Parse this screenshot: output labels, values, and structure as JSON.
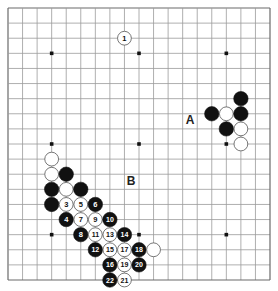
{
  "diagram": {
    "type": "go-board",
    "size": 19,
    "colors": {
      "background": "#ffffff",
      "grid_line": "#9a9a9a",
      "edge_line": "#6a6a6a",
      "black_stone": "#111111",
      "white_stone": "#ffffff",
      "white_stone_border": "#555555",
      "hoshi": "#111111",
      "label_text": "#222222"
    },
    "hoshi": [
      {
        "col": 3,
        "row": 3
      },
      {
        "col": 9,
        "row": 3
      },
      {
        "col": 15,
        "row": 3
      },
      {
        "col": 3,
        "row": 9
      },
      {
        "col": 9,
        "row": 9
      },
      {
        "col": 15,
        "row": 9
      },
      {
        "col": 3,
        "row": 15
      },
      {
        "col": 9,
        "row": 15
      },
      {
        "col": 15,
        "row": 15
      }
    ],
    "stones": [
      {
        "color": "white",
        "col": 8,
        "row": 2,
        "label": "1"
      },
      {
        "color": "black",
        "col": 16,
        "row": 6,
        "label": ""
      },
      {
        "color": "black",
        "col": 14,
        "row": 7,
        "label": ""
      },
      {
        "color": "white",
        "col": 15,
        "row": 7,
        "label": ""
      },
      {
        "color": "black",
        "col": 16,
        "row": 7,
        "label": ""
      },
      {
        "color": "black",
        "col": 15,
        "row": 8,
        "label": ""
      },
      {
        "color": "white",
        "col": 16,
        "row": 8,
        "label": ""
      },
      {
        "color": "white",
        "col": 16,
        "row": 9,
        "label": ""
      },
      {
        "color": "white",
        "col": 3,
        "row": 10,
        "label": ""
      },
      {
        "color": "white",
        "col": 3,
        "row": 11,
        "label": ""
      },
      {
        "color": "black",
        "col": 4,
        "row": 11,
        "label": ""
      },
      {
        "color": "black",
        "col": 3,
        "row": 12,
        "label": ""
      },
      {
        "color": "white",
        "col": 4,
        "row": 12,
        "label": ""
      },
      {
        "color": "black",
        "col": 5,
        "row": 12,
        "label": ""
      },
      {
        "color": "black",
        "col": 3,
        "row": 13,
        "label": ""
      },
      {
        "color": "white",
        "col": 4,
        "row": 13,
        "label": "3"
      },
      {
        "color": "black",
        "col": 4,
        "row": 14,
        "label": "4"
      },
      {
        "color": "white",
        "col": 5,
        "row": 13,
        "label": "5"
      },
      {
        "color": "black",
        "col": 6,
        "row": 13,
        "label": "6"
      },
      {
        "color": "white",
        "col": 5,
        "row": 14,
        "label": "7"
      },
      {
        "color": "black",
        "col": 5,
        "row": 15,
        "label": "8"
      },
      {
        "color": "white",
        "col": 6,
        "row": 14,
        "label": "9"
      },
      {
        "color": "black",
        "col": 7,
        "row": 14,
        "label": "10"
      },
      {
        "color": "white",
        "col": 6,
        "row": 15,
        "label": "11"
      },
      {
        "color": "black",
        "col": 6,
        "row": 16,
        "label": "12"
      },
      {
        "color": "white",
        "col": 7,
        "row": 15,
        "label": "13"
      },
      {
        "color": "black",
        "col": 8,
        "row": 15,
        "label": "14"
      },
      {
        "color": "white",
        "col": 7,
        "row": 16,
        "label": "15"
      },
      {
        "color": "black",
        "col": 7,
        "row": 17,
        "label": "16"
      },
      {
        "color": "white",
        "col": 8,
        "row": 16,
        "label": "17"
      },
      {
        "color": "black",
        "col": 9,
        "row": 16,
        "label": "18"
      },
      {
        "color": "white",
        "col": 8,
        "row": 17,
        "label": "19"
      },
      {
        "color": "black",
        "col": 9,
        "row": 17,
        "label": "20"
      },
      {
        "color": "white",
        "col": 8,
        "row": 18,
        "label": "21"
      },
      {
        "color": "black",
        "col": 7,
        "row": 18,
        "label": "22"
      },
      {
        "color": "white",
        "col": 10,
        "row": 16,
        "label": ""
      }
    ],
    "letter_labels": [
      {
        "text": "A",
        "x": 190,
        "y": 120
      },
      {
        "text": "B",
        "x": 131,
        "y": 181
      }
    ]
  }
}
